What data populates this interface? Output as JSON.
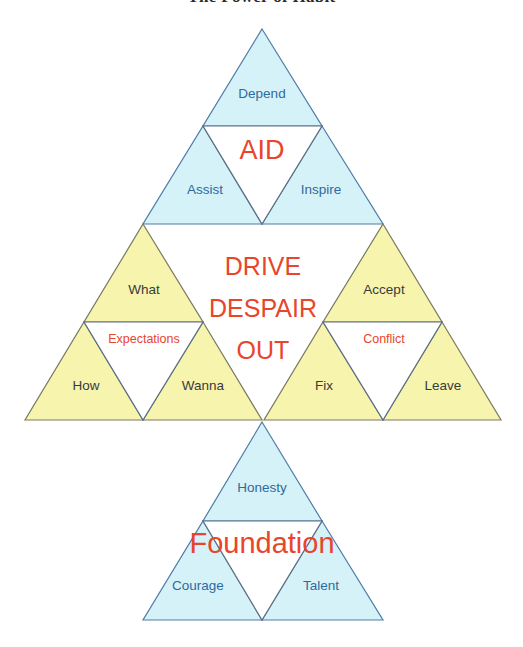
{
  "title": {
    "text": "The Power of Habit",
    "visible": "clipped"
  },
  "colors": {
    "cyan_fill": "#d5f2f8",
    "yellow_fill": "#f7f4ae",
    "white_fill": "#ffffff",
    "cyan_stroke": "#4f7ca8",
    "yellow_stroke": "#7a7a63",
    "label_blue": "#2f6a9e",
    "label_dark": "#3a3a3a",
    "accent_red": "#e8452c",
    "background": "#ffffff"
  },
  "diagram": {
    "type": "nested-triangle-framework",
    "groups": [
      {
        "id": "aid",
        "fill": "cyan",
        "center_label": "AID",
        "position": "top",
        "corners": {
          "top": "Depend",
          "bottom_left": "Assist",
          "bottom_right": "Inspire"
        }
      },
      {
        "id": "expectations",
        "fill": "yellow",
        "center_label": "Expectations",
        "position": "middle-left",
        "corners": {
          "top": "What",
          "bottom_left": "How",
          "bottom_right": "Wanna"
        }
      },
      {
        "id": "conflict",
        "fill": "yellow",
        "center_label": "Conflict",
        "position": "middle-right",
        "corners": {
          "top": "Accept",
          "bottom_left": "Fix",
          "bottom_right": "Leave"
        }
      },
      {
        "id": "foundation",
        "fill": "cyan",
        "center_label": "Foundation",
        "position": "bottom",
        "corners": {
          "top": "Honesty",
          "bottom_left": "Courage",
          "bottom_right": "Talent"
        }
      }
    ],
    "core_message": {
      "line1": "DRIVE",
      "line2": "DESPAIR",
      "line3": "OUT"
    }
  }
}
